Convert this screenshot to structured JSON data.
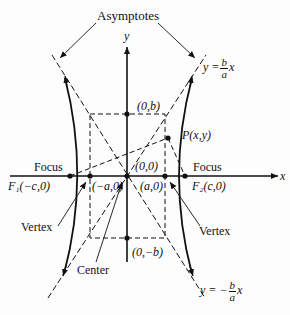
{
  "diagram": {
    "callouts": {
      "asymptotes": "Asymptotes",
      "focus_left": "Focus",
      "focus_right": "Focus",
      "vertex_left": "Vertex",
      "vertex_right": "Vertex",
      "center": "Center"
    },
    "axes": {
      "x": "x",
      "y": "y"
    },
    "points": {
      "top_co_vertex": "(0,b)",
      "bottom_co_vertex": "(0,−b)",
      "origin": "(0,0)",
      "left_vertex": "(−a,0)",
      "right_vertex": "(a,0)",
      "left_focus": "F₁(−c,0)",
      "right_focus": "F₂(c,0)",
      "point_p": "P(x,y)"
    },
    "asymptote_equations": {
      "upper": {
        "lhs": "y =",
        "num": "b",
        "den": "a",
        "rhs": "x"
      },
      "lower": {
        "lhs": "y = −",
        "num": "b",
        "den": "a",
        "rhs": "x"
      }
    }
  }
}
